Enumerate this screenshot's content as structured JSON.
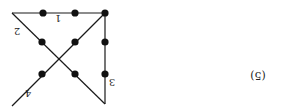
{
  "figure": {
    "label": "(5)",
    "orientation": "rotated-180",
    "line_color": "#1a1a1a",
    "dot_color": "#111111",
    "dots": [
      {
        "x": 105,
        "y": 13
      },
      {
        "x": 75,
        "y": 13
      },
      {
        "x": 43,
        "y": 13
      },
      {
        "x": 105,
        "y": 42
      },
      {
        "x": 75,
        "y": 42
      },
      {
        "x": 42,
        "y": 42
      },
      {
        "x": 105,
        "y": 74
      },
      {
        "x": 75,
        "y": 74
      },
      {
        "x": 42,
        "y": 74
      }
    ],
    "lines": [
      {
        "id": "1",
        "label": "1",
        "x1": 12,
        "y1": 13,
        "x2": 105,
        "y2": 13,
        "lx": 58,
        "ly": 22
      },
      {
        "id": "2",
        "label": "2",
        "x1": 12,
        "y1": 13,
        "x2": 105,
        "y2": 104,
        "lx": 17,
        "ly": 35
      },
      {
        "id": "3",
        "label": "3",
        "x1": 105,
        "y1": 13,
        "x2": 105,
        "y2": 104,
        "lx": 112,
        "ly": 86
      },
      {
        "id": "4",
        "label": "4",
        "x1": 105,
        "y1": 13,
        "x2": 12,
        "y2": 106,
        "lx": 28,
        "ly": 97
      }
    ]
  }
}
